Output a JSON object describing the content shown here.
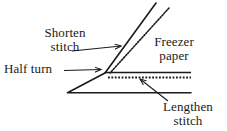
{
  "figure": {
    "background_color": "#ffffff",
    "ink_color": "#1a1a1a",
    "width": 227,
    "height": 131
  },
  "labels": {
    "shorten_stitch": {
      "line1": "Shorten",
      "line2": "stitch"
    },
    "half_turn": {
      "line1": "Half turn",
      "line2": ""
    },
    "freezer_paper": {
      "line1": "Freezer",
      "line2": "paper"
    },
    "lengthen_stitch": {
      "line1": "Lengthen",
      "line2": "stitch"
    }
  },
  "diagram_elements": {
    "fold_line_diagonal": "solid-diagonal-line",
    "stitch_line_diagonal": "dotted-diagonal-line",
    "fold_line_horizontal": "solid-horizontal-line",
    "stitch_line_horizontal": "dotted-horizontal-line",
    "fabric_edge_lower": "solid-lower-edge-line",
    "pointer_shorten": "leader-arrow",
    "pointer_half_turn": "leader-arrow",
    "pointer_lengthen": "leader-arrow"
  }
}
